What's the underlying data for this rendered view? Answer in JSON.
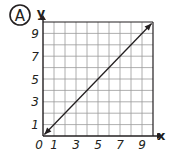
{
  "badge": "A",
  "chart_data": {
    "type": "line",
    "title": "",
    "xlabel": "x",
    "ylabel": "y",
    "xlim": [
      0,
      10
    ],
    "ylim": [
      0,
      10
    ],
    "grid": true,
    "origin_label": "0",
    "x_tick_labels": [
      {
        "value": 1,
        "label": "1"
      },
      {
        "value": 3,
        "label": "3"
      },
      {
        "value": 5,
        "label": "5"
      },
      {
        "value": 7,
        "label": "7"
      },
      {
        "value": 9,
        "label": "9"
      }
    ],
    "y_tick_labels": [
      {
        "value": 1,
        "label": "1"
      },
      {
        "value": 3,
        "label": "3"
      },
      {
        "value": 5,
        "label": "5"
      },
      {
        "value": 7,
        "label": "7"
      },
      {
        "value": 9,
        "label": "9"
      }
    ],
    "series": [
      {
        "name": "line",
        "x": [
          0,
          10
        ],
        "y": [
          0,
          10
        ],
        "arrows": "both"
      }
    ],
    "colors": {
      "ink": "#231f20",
      "grid": "#9a9a9a"
    }
  }
}
